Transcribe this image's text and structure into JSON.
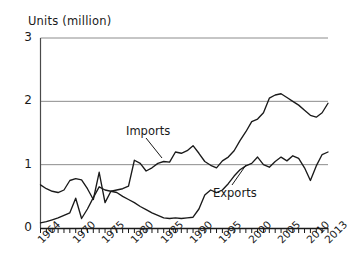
{
  "chart_data": {
    "type": "line",
    "title": "Units (million)",
    "xlabel": "",
    "ylabel": "Units (million)",
    "ylim": [
      0,
      3
    ],
    "xlim": [
      1964,
      2013
    ],
    "grid": true,
    "legend_position": "inline-annotations",
    "y_ticks": [
      "0",
      "1",
      "2",
      "3"
    ],
    "y_tick_values": [
      0,
      1,
      2,
      3
    ],
    "x_ticks": [
      "1964",
      "1970",
      "1975",
      "1980",
      "1985",
      "1990",
      "1995",
      "2000",
      "2005",
      "2010",
      "2013"
    ],
    "x_tick_values": [
      1964,
      1970,
      1975,
      1980,
      1985,
      1990,
      1995,
      2000,
      2005,
      2010,
      2013
    ],
    "x_minor_tick_interval": 1,
    "annotations": [
      {
        "text": "Imports",
        "points_to_year": 1987,
        "points_to_value": 1.2
      },
      {
        "text": "Exports",
        "points_to_year": 2000,
        "points_to_value": 1.0
      }
    ],
    "x": [
      1964,
      1965,
      1966,
      1967,
      1968,
      1969,
      1970,
      1971,
      1972,
      1973,
      1974,
      1975,
      1976,
      1977,
      1978,
      1979,
      1980,
      1981,
      1982,
      1983,
      1984,
      1985,
      1986,
      1987,
      1988,
      1989,
      1990,
      1991,
      1992,
      1993,
      1994,
      1995,
      1996,
      1997,
      1998,
      1999,
      2000,
      2001,
      2002,
      2003,
      2004,
      2005,
      2006,
      2007,
      2008,
      2009,
      2010,
      2011,
      2012,
      2013
    ],
    "series": [
      {
        "name": "Imports",
        "color": "#1a1a1a",
        "values": [
          0.68,
          0.62,
          0.58,
          0.56,
          0.6,
          0.75,
          0.78,
          0.76,
          0.62,
          0.45,
          0.88,
          0.4,
          0.58,
          0.6,
          0.62,
          0.66,
          1.07,
          1.02,
          0.9,
          0.95,
          1.02,
          1.05,
          1.04,
          1.2,
          1.18,
          1.22,
          1.3,
          1.18,
          1.05,
          0.99,
          0.95,
          1.06,
          1.12,
          1.22,
          1.38,
          1.52,
          1.68,
          1.72,
          1.82,
          2.05,
          2.1,
          2.12,
          2.06,
          2.0,
          1.94,
          1.86,
          1.78,
          1.75,
          1.82,
          1.97
        ]
      },
      {
        "name": "Exports",
        "color": "#1a1a1a",
        "values": [
          0.08,
          0.1,
          0.13,
          0.16,
          0.2,
          0.24,
          0.47,
          0.15,
          0.3,
          0.48,
          0.65,
          0.6,
          0.58,
          0.56,
          0.5,
          0.45,
          0.4,
          0.34,
          0.29,
          0.24,
          0.2,
          0.16,
          0.15,
          0.16,
          0.15,
          0.16,
          0.17,
          0.3,
          0.52,
          0.6,
          0.56,
          0.6,
          0.7,
          0.82,
          0.92,
          0.98,
          1.02,
          1.12,
          1.0,
          0.96,
          1.05,
          1.12,
          1.06,
          1.14,
          1.1,
          0.95,
          0.75,
          0.98,
          1.16,
          1.2
        ]
      }
    ]
  }
}
